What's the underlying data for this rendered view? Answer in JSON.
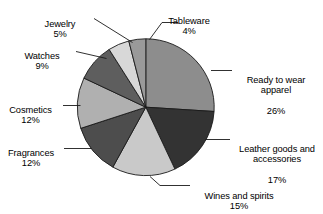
{
  "chart_data": {
    "type": "pie",
    "title": "",
    "subtitle": "",
    "xlabel": "",
    "ylabel": "",
    "legend_position": "callout-labels",
    "grid": false,
    "units": "percent",
    "start_angle_deg": 0,
    "direction": "clockwise",
    "categories": [
      "Ready to wear apparel",
      "Leather goods and accessories",
      "Wines and spirits",
      "Fragrances",
      "Cosmetics",
      "Watches",
      "Jewelry",
      "Tableware"
    ],
    "values": [
      26,
      17,
      15,
      12,
      12,
      9,
      5,
      4
    ],
    "slices": [
      {
        "name": "ready-to-wear-apparel",
        "label": "Ready to wear\napparel",
        "label_line1": "Ready to wear",
        "label_line2": "apparel",
        "value": 26,
        "percent": "26%",
        "color": "#8d8d8d",
        "start_deg": 0,
        "end_deg": 93.6
      },
      {
        "name": "leather-goods-and-accessories",
        "label": "Leather goods and\naccessories",
        "label_line1": "Leather goods and",
        "label_line2": "accessories",
        "value": 17,
        "percent": "17%",
        "color": "#333333",
        "start_deg": 93.6,
        "end_deg": 154.8
      },
      {
        "name": "wines-and-spirits",
        "label": "Wines and spirits",
        "label_line1": "Wines and spirits",
        "label_line2": "",
        "value": 15,
        "percent": "15%",
        "color": "#c9c9c9",
        "start_deg": 154.8,
        "end_deg": 208.8
      },
      {
        "name": "fragrances",
        "label": "Fragrances",
        "label_line1": "Fragrances",
        "label_line2": "",
        "value": 12,
        "percent": "12%",
        "color": "#4d4d4d",
        "start_deg": 208.8,
        "end_deg": 252.0
      },
      {
        "name": "cosmetics",
        "label": "Cosmetics",
        "label_line1": "Cosmetics",
        "label_line2": "",
        "value": 12,
        "percent": "12%",
        "color": "#b0b0b0",
        "start_deg": 252.0,
        "end_deg": 295.2
      },
      {
        "name": "watches",
        "label": "Watches",
        "label_line1": "Watches",
        "label_line2": "",
        "value": 9,
        "percent": "9%",
        "color": "#5e5e5e",
        "start_deg": 295.2,
        "end_deg": 327.6
      },
      {
        "name": "jewelry",
        "label": "Jewelry",
        "label_line1": "Jewelry",
        "label_line2": "",
        "value": 5,
        "percent": "5%",
        "color": "#d8d8d8",
        "start_deg": 327.6,
        "end_deg": 345.6
      },
      {
        "name": "tableware",
        "label": "Tableware",
        "label_line1": "Tableware",
        "label_line2": "",
        "value": 4,
        "percent": "4%",
        "color": "#9a9a9a",
        "start_deg": 345.6,
        "end_deg": 360.0
      }
    ],
    "colors": {
      "outline": "#1a1a1a",
      "background": "#ffffff",
      "text": "#000000",
      "leader_line": "#1a1a1a"
    }
  }
}
